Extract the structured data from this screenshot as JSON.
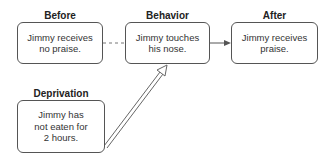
{
  "nodes": {
    "before": {
      "title": "Before",
      "text": "Jimmy receives no praise."
    },
    "behavior": {
      "title": "Behavior",
      "text": "Jimmy touches his nose."
    },
    "after": {
      "title": "After",
      "text": "Jimmy receives praise."
    },
    "deprivation": {
      "title": "Deprivation",
      "text": "Jimmy has not eaten for 2 hours."
    }
  },
  "edges": [
    {
      "from": "before",
      "to": "behavior",
      "style": "dashed"
    },
    {
      "from": "behavior",
      "to": "after",
      "style": "solid-arrow"
    },
    {
      "from": "deprivation",
      "to": "behavior",
      "style": "double-line-hollow-arrow"
    }
  ],
  "colors": {
    "stroke": "#555555",
    "text": "#333333"
  }
}
